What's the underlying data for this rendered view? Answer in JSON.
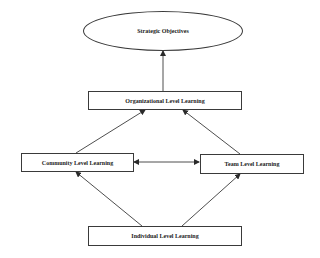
{
  "diagram": {
    "nodes": {
      "strategic": {
        "label": "Strategic Objectives"
      },
      "organizational": {
        "label": "Organizational Level Learning"
      },
      "community": {
        "label": "Community Level Learning"
      },
      "team": {
        "label": "Team Level Learning"
      },
      "individual": {
        "label": "Individual Level Learning"
      }
    },
    "edges": [
      {
        "from": "Organizational Level Learning",
        "to": "Strategic Objectives",
        "direction": "forward"
      },
      {
        "from": "Community Level Learning",
        "to": "Organizational Level Learning",
        "direction": "forward"
      },
      {
        "from": "Team Level Learning",
        "to": "Organizational Level Learning",
        "direction": "forward"
      },
      {
        "from": "Community Level Learning",
        "to": "Team Level Learning",
        "direction": "bidirectional"
      },
      {
        "from": "Individual Level Learning",
        "to": "Community Level Learning",
        "direction": "forward"
      },
      {
        "from": "Individual Level Learning",
        "to": "Team Level Learning",
        "direction": "forward"
      }
    ],
    "colors": {
      "stroke": "#3a3a3a",
      "background": "#ffffff",
      "text": "#222222"
    }
  }
}
